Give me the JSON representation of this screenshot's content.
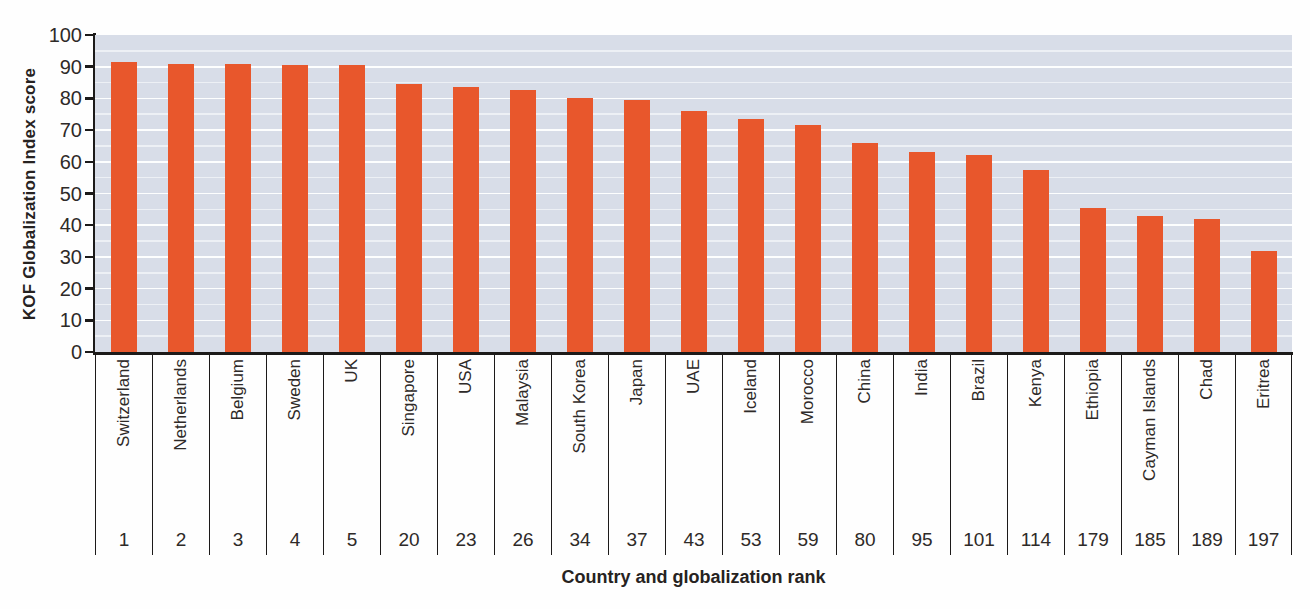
{
  "chart_data": {
    "type": "bar",
    "title": "",
    "ylabel": "KOF Globalization Index score",
    "xlabel": "Country and globalization rank",
    "ylim": [
      0,
      100
    ],
    "y_ticks": [
      0,
      10,
      20,
      30,
      40,
      50,
      60,
      70,
      80,
      90,
      100
    ],
    "gridlines": {
      "orientation": "horizontal",
      "interval": 5,
      "color": "#ffffff"
    },
    "legend": "none",
    "bar_color": "#e8572c",
    "plot_background": "#d8dde8",
    "categories": [
      "Switzerland",
      "Netherlands",
      "Belgium",
      "Sweden",
      "UK",
      "Singapore",
      "USA",
      "Malaysia",
      "South Korea",
      "Japan",
      "UAE",
      "Iceland",
      "Morocco",
      "China",
      "India",
      "Brazil",
      "Kenya",
      "Ethiopia",
      "Cayman Islands",
      "Chad",
      "Eritrea"
    ],
    "ranks": [
      "1",
      "2",
      "3",
      "4",
      "5",
      "20",
      "23",
      "26",
      "34",
      "37",
      "43",
      "53",
      "59",
      "80",
      "95",
      "101",
      "114",
      "179",
      "185",
      "189",
      "197"
    ],
    "values": [
      91.5,
      91,
      91,
      90.5,
      90.5,
      84.5,
      83.5,
      82.5,
      80,
      79.5,
      76,
      73.5,
      71.5,
      66,
      63,
      62,
      57.5,
      45.5,
      43,
      42,
      32
    ]
  }
}
